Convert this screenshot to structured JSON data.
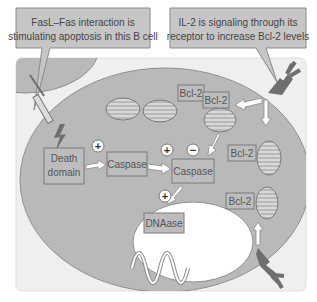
{
  "callouts": {
    "left": {
      "line1": "FasL–Fas interaction is",
      "line2": "stimulating apoptosis in this B cell"
    },
    "right": {
      "line1": "IL-2 is signaling through its",
      "line2": "receptor to increase Bcl-2 levels"
    }
  },
  "boxes": {
    "death_domain": {
      "line1": "Death",
      "line2": "domain"
    },
    "caspase_1": "Caspase",
    "caspase_2": "Caspase",
    "dnaase": "DNAase",
    "bcl2_top_left": "Bcl-2",
    "bcl2_top_right": "Bcl-2",
    "bcl2_mid_right": "Bcl-2",
    "bcl2_bottom_right": "Bcl-2"
  },
  "signs": {
    "plus": "+",
    "minus": "−"
  },
  "colors": {
    "panel_bg": "#efefef",
    "cell": "#b9b9b9",
    "nucleus": "#ffffff",
    "callout_bg": "#c6c6c6",
    "box_bg": "#bdbdbd",
    "box_border": "#7a7a7a",
    "receptor": "#6e6e6e",
    "text": "#555555"
  }
}
